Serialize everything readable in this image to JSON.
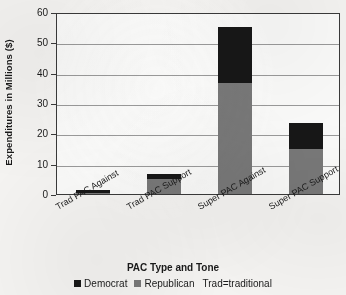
{
  "chart_data": {
    "type": "bar",
    "stacked": true,
    "title": "",
    "xlabel": "PAC Type and Tone",
    "ylabel": "Expenditures in Millions ($)",
    "categories": [
      "Trad PAC Against",
      "Trad PAC Support",
      "Super PAC Against",
      "Super PAC Support"
    ],
    "series": [
      {
        "name": "Democrat",
        "color": "#171717",
        "values": [
          1.0,
          1.5,
          18.5,
          8.5
        ]
      },
      {
        "name": "Republican",
        "color": "#787878",
        "values": [
          0.2,
          5.0,
          36.5,
          15.0
        ]
      }
    ],
    "totals": [
      1.2,
      6.5,
      55.0,
      23.5
    ],
    "ylim": [
      0,
      60
    ],
    "yticks": [
      0,
      10,
      20,
      30,
      40,
      50,
      60
    ],
    "ytick_labels": [
      "0",
      "10",
      "20",
      "30",
      "40",
      "50",
      "60"
    ],
    "grid": true,
    "legend_position": "bottom",
    "legend_note": "Trad=traditional"
  },
  "legend": {
    "democrat_label": "Democrat",
    "republican_label": "Republican",
    "note": "Trad=traditional"
  }
}
